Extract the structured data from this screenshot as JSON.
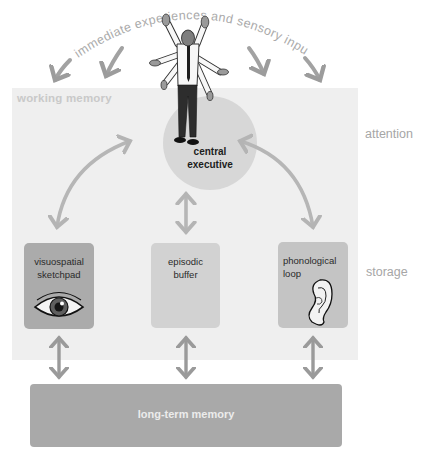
{
  "diagram": {
    "title_arc": "immediate experiences and sensory input",
    "working_memory_label": "working memory",
    "side_labels": {
      "attention": "attention",
      "storage": "storage"
    },
    "central_executive": {
      "line1": "central",
      "line2": "executive",
      "icon": "multi-armed-person-icon"
    },
    "components": [
      {
        "line1": "visuospatial",
        "line2": "sketchpad",
        "icon": "eye-icon"
      },
      {
        "line1": "episodic",
        "line2": "buffer",
        "icon": ""
      },
      {
        "line1": "phonological",
        "line2": "loop",
        "icon": "ear-icon"
      }
    ],
    "long_term_memory": "long-term memory",
    "colors": {
      "panel": "#efefef",
      "circle": "#d7d7d7",
      "visuospatial": "#ababab",
      "episodic": "#d2d2d2",
      "phonological": "#c4c4c4",
      "long_term": "#a9a9a9",
      "arrow": "#b0b0b0",
      "side_label": "#a6a6a6"
    }
  }
}
